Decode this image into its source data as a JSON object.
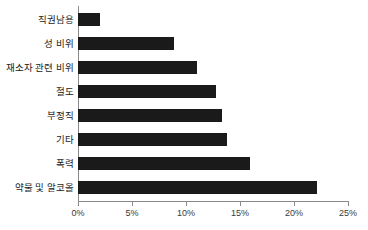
{
  "chart_data": {
    "type": "bar",
    "orientation": "horizontal",
    "title": "",
    "subtitle": "",
    "xlabel": "",
    "ylabel": "",
    "categories": [
      "직권남용",
      "성 비위",
      "재소자 관련 비위",
      "절도",
      "부정직",
      "기타",
      "폭력",
      "약물 및 알코올"
    ],
    "values": [
      2.0,
      8.9,
      11.0,
      12.8,
      13.3,
      13.8,
      15.9,
      22.1
    ],
    "value_unit": "%",
    "xlim": [
      0,
      25
    ],
    "tick_values": [
      0,
      5,
      10,
      15,
      20,
      25
    ],
    "tick_labels": [
      "0%",
      "5%",
      "10%",
      "15%",
      "20%",
      "25%"
    ],
    "grid": false,
    "legend": false,
    "legend_position": "none",
    "bar_color": "#1a1a1a",
    "axis_color": "#8b8b8b",
    "background_color": "#ffffff"
  }
}
